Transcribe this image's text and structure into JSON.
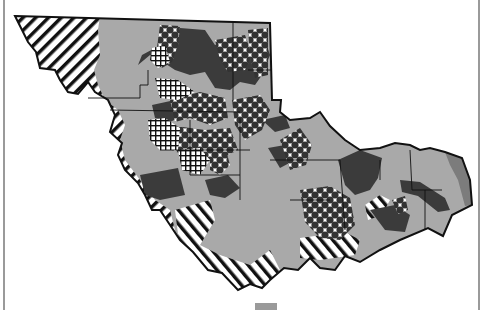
{
  "map": {
    "type": "thematic-patterned-region-map",
    "legend": [],
    "colors": {
      "background": "#ffffff",
      "outline": "#111111",
      "light_gray": "#a9a9a9",
      "dark_gray": "#3b3b3b",
      "mid_gray": "#7c7c7c",
      "frame": "#9a9a9a"
    },
    "fill_classes": [
      {
        "id": "hatch-diagonal",
        "description": "white with black diagonal stripes"
      },
      {
        "id": "light-gray",
        "description": "solid light gray"
      },
      {
        "id": "dark-gray",
        "description": "solid dark gray"
      },
      {
        "id": "diamond-checker",
        "description": "white with dark diamond checker pattern"
      },
      {
        "id": "crosshatch-grid",
        "description": "white with black grid crosshatch"
      }
    ]
  }
}
